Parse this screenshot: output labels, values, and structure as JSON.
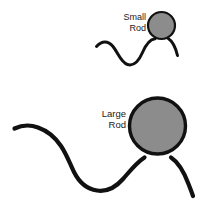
{
  "figure": {
    "background_color": "#ffffff",
    "width": 204,
    "height": 213
  },
  "style": {
    "head_fill": "#8c8c8c",
    "head_stroke": "#111111",
    "tail_stroke": "#111111",
    "label_color": "#1a1a1a"
  },
  "items": [
    {
      "id": "small-rod",
      "label_line1": "Small",
      "label_line2": "Rod",
      "label_x": 146,
      "label_y1": 20,
      "label_y2": 31,
      "head": {
        "cx": 161.5,
        "cy": 25.5,
        "r": 13.5,
        "stroke_width": 2.2
      },
      "tail": {
        "stroke_width": 3.0,
        "path": "M 96.5 46.5 C 102 40.5 108 40.5 113 46.5 C 118.5 53.5 121 62.5 127.5 64.5 C 134 66.5 139 60.5 142.5 52.5 C 145.5 45.5 149.5 39.5 155 38.8 M 168.5 38.8 C 173 41.5 175.5 47.5 177.5 55.5"
      }
    },
    {
      "id": "large-rod",
      "label_line1": "Large",
      "label_line2": "Rod",
      "label_x": 126,
      "label_y1": 117,
      "label_y2": 128,
      "head": {
        "cx": 157.5,
        "cy": 126,
        "r": 28,
        "stroke_width": 3.4
      },
      "tail": {
        "stroke_width": 4.2,
        "path": "M 14.5 128.5 C 22 125 30 124.5 38 127.5 C 48 131 55 137 61 146 C 67 155 70 164 74 172 C 79 182 87 189 97 190.5 C 107 192 116 187 123 179 C 130 171 136 163 144.5 157.5 M 171 157.5 C 178 162 184 172 188.5 184 C 190.5 189 192 193 193 196"
      }
    }
  ]
}
